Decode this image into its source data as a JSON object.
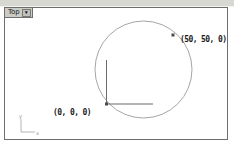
{
  "viewport": {
    "tab": {
      "label": "Top",
      "menu_icon": "▼"
    }
  },
  "drawing": {
    "shape": "circle",
    "origin_point": {
      "label": "(0, 0, 0)",
      "x": 0,
      "y": 0,
      "z": 0
    },
    "circle_point": {
      "label": "(50, 50, 0)",
      "x": 50,
      "y": 50,
      "z": 0
    }
  },
  "axis_indicator": {
    "x_label": "x",
    "y_label": "y"
  },
  "colors": {
    "top_band": "#d8d8d2",
    "viewport_border": "#6e6e6e",
    "tab_background": "#ccccc6",
    "circle_stroke": "#9b9b9b",
    "axis_line": "#6b6b6b",
    "point_marker": "#4a4a4a",
    "label_text": "#1c1c1c",
    "ucs_icon": "#a8a8a8"
  }
}
